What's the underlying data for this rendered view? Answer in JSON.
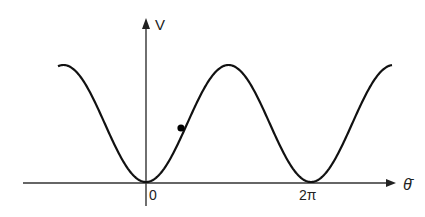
{
  "diagram": {
    "type": "potential-curve",
    "axes": {
      "y_label": "V",
      "x_label": "θ̄",
      "x_ticks": [
        {
          "label": "0",
          "value": "0"
        },
        {
          "label": "2π",
          "value": "2π"
        }
      ]
    },
    "curve": {
      "shape": "1 - cos(theta)",
      "minima_at": [
        "0",
        "2π"
      ],
      "maxima_visible": 3
    },
    "ball": {
      "position": "on curve slightly right of 0, on rising slope"
    },
    "colors": {
      "line": "#111111",
      "axis": "#333333",
      "background": "#ffffff"
    }
  }
}
